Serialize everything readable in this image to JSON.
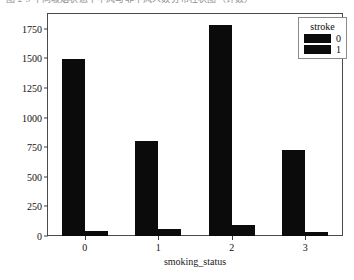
{
  "caption": {
    "text": "图 2-5  不同吸烟状态下中风与非中风人数分布柱状图（计数）"
  },
  "chart_data": {
    "type": "bar",
    "title": "",
    "subtitle": "",
    "xlabel": "smoking_status",
    "ylabel": "count",
    "categories": [
      "0",
      "1",
      "2",
      "3"
    ],
    "series": [
      {
        "name": "0",
        "values": [
          1495,
          800,
          1785,
          730
        ],
        "color": "#0b0b0b"
      },
      {
        "name": "1",
        "values": [
          45,
          60,
          90,
          35
        ],
        "color": "#0b0b0b"
      }
    ],
    "ylim": [
      0,
      1875
    ],
    "yticks": [
      "0",
      "250",
      "500",
      "750",
      "1000",
      "1250",
      "1500",
      "1750"
    ],
    "ytick_values": [
      0,
      250,
      500,
      750,
      1000,
      1250,
      1500,
      1750
    ],
    "xticks": [
      "0",
      "1",
      "2",
      "3"
    ],
    "grid": false,
    "legend": {
      "title": "stroke",
      "position": "upper-right",
      "entries": [
        {
          "label": "0",
          "color": "#0b0b0b"
        },
        {
          "label": "1",
          "color": "#0b0b0b"
        }
      ]
    }
  }
}
